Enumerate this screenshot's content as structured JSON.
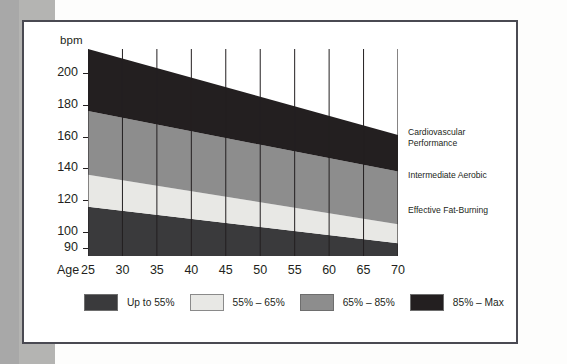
{
  "figure": {
    "y_axis_title": "bpm",
    "x_axis_title": "Age",
    "y_ticks": [
      "200",
      "180",
      "160",
      "140",
      "120",
      "100",
      "90"
    ],
    "x_ticks": [
      "25",
      "30",
      "35",
      "40",
      "45",
      "50",
      "55",
      "60",
      "65",
      "70"
    ],
    "zone_annotations": [
      "Cardiovascular\nPerformance",
      "Intermediate Aerobic",
      "Effective Fat-Burning"
    ],
    "legend": [
      {
        "label": "Up to 55%",
        "color": "#3a3a3c"
      },
      {
        "label": "55% – 65%",
        "color": "#e8e8e5"
      },
      {
        "label": "65% – 85%",
        "color": "#8d8d8d"
      },
      {
        "label": "85% – Max",
        "color": "#231f20"
      }
    ]
  },
  "chart_data": {
    "type": "area",
    "title": "",
    "subtitle": "",
    "xlabel": "Age",
    "ylabel": "bpm",
    "xlim": [
      25,
      70
    ],
    "ylim": [
      85,
      215
    ],
    "grid": false,
    "gridlines": "vertical lines at each age tick",
    "legend_position": "bottom",
    "x": [
      25,
      30,
      35,
      40,
      45,
      50,
      55,
      60,
      65,
      70
    ],
    "x_tick_labels": [
      "25",
      "30",
      "35",
      "40",
      "45",
      "50",
      "55",
      "60",
      "65",
      "70"
    ],
    "y_tick_labels": [
      "200",
      "180",
      "160",
      "140",
      "120",
      "100",
      "90"
    ],
    "y_tick_values": [
      200,
      180,
      160,
      140,
      120,
      100,
      90
    ],
    "boundaries": {
      "max_heart_rate": [
        195,
        190,
        185,
        180,
        175,
        170,
        165,
        160,
        155,
        150
      ],
      "pct_85": [
        166,
        162,
        157,
        153,
        149,
        145,
        140,
        136,
        132,
        128
      ],
      "pct_65": [
        127,
        124,
        120,
        117,
        114,
        111,
        107,
        104,
        101,
        98
      ],
      "pct_55": [
        108,
        105,
        102,
        99,
        96,
        94,
        91,
        88,
        85,
        83
      ],
      "baseline": [
        85,
        85,
        85,
        85,
        85,
        85,
        85,
        85,
        85,
        85
      ]
    },
    "series": [
      {
        "name": "Up to 55%",
        "zone_label": "Effective Fat-Burning",
        "color": "#3a3a3c",
        "band_top_left": 116,
        "band_top_right": 93,
        "band_bottom": 85
      },
      {
        "name": "55% – 65%",
        "zone_label": "Intermediate Aerobic",
        "color": "#e8e8e5",
        "band_top_left": 136,
        "band_top_right": 105,
        "band_bottom_left": 116,
        "band_bottom_right": 93
      },
      {
        "name": "65% – 85%",
        "zone_label": "Intermediate Aerobic / Cardiovascular",
        "color": "#8d8d8d",
        "band_top_left": 176,
        "band_top_right": 138,
        "band_bottom_left": 136,
        "band_bottom_right": 105
      },
      {
        "name": "85% – Max",
        "zone_label": "Cardiovascular Performance",
        "color": "#231f20",
        "band_top_left": 215,
        "band_top_right": 161,
        "band_bottom_left": 176,
        "band_bottom_right": 138
      }
    ],
    "annotations": [
      {
        "text": "Cardiovascular Performance",
        "target_series": "85% – Max"
      },
      {
        "text": "Intermediate Aerobic",
        "target_series": "65% – 85%"
      },
      {
        "text": "Effective Fat-Burning",
        "target_series": "Up to 55%"
      }
    ]
  }
}
